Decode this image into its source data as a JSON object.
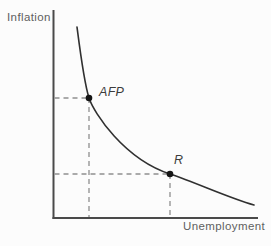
{
  "diagram": {
    "kind": "phillips-curve",
    "axes": {
      "y_label": "Inflation",
      "x_label": "Unemployment"
    },
    "points": [
      {
        "label": "AFP",
        "px": 89,
        "py": 98
      },
      {
        "label": "R",
        "px": 170,
        "py": 174
      }
    ],
    "curve": {
      "name": "phillips-curve",
      "path": "M77,27 C81,58 84,82 89,98 C94,113 124,159 170,174 C197,183 229,198 254,205"
    },
    "colors": {
      "axis": "#4a4a4a",
      "curve": "#303030",
      "guide_dashed": "#8f8f8f",
      "axis_label_text": "#5f5f5f",
      "point_label_text": "#3c3c3c",
      "point_dot": "#151515",
      "background": "#fcfcfc"
    }
  }
}
